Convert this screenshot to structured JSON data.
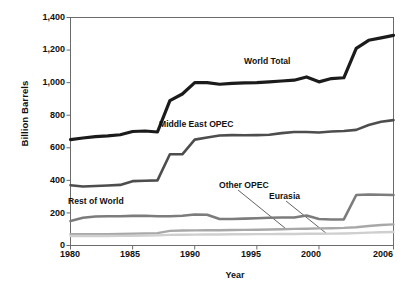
{
  "chart_data": {
    "type": "line",
    "title": "",
    "xlabel": "Year",
    "ylabel": "Billion Barrels",
    "xlim": [
      1980,
      2006
    ],
    "ylim": [
      0,
      1400
    ],
    "grid": false,
    "legend_position": "inline-labels",
    "xticks": [
      "1980",
      "1985",
      "1990",
      "1995",
      "2000",
      "2006"
    ],
    "xtick_values": [
      1980,
      1985,
      1990,
      1995,
      2000,
      2006
    ],
    "yticks": [
      "0",
      "200",
      "400",
      "600",
      "800",
      "1,000",
      "1,200",
      "1,400"
    ],
    "ytick_values": [
      0,
      200,
      400,
      600,
      800,
      1000,
      1200,
      1400
    ],
    "x": [
      1980,
      1981,
      1982,
      1983,
      1984,
      1985,
      1986,
      1987,
      1988,
      1989,
      1990,
      1991,
      1992,
      1993,
      1994,
      1995,
      1996,
      1997,
      1998,
      1999,
      2000,
      2001,
      2002,
      2003,
      2004,
      2005,
      2006
    ],
    "series": [
      {
        "name": "World Total",
        "color": "#1b1b1b",
        "width": 3.2,
        "values": [
          650,
          660,
          668,
          673,
          680,
          700,
          703,
          697,
          890,
          930,
          1000,
          1000,
          990,
          995,
          998,
          1000,
          1005,
          1010,
          1015,
          1035,
          1005,
          1025,
          1030,
          1210,
          1260,
          1275,
          1290
        ]
      },
      {
        "name": "Middle East OPEC",
        "color": "#4d4d4d",
        "width": 2.6,
        "values": [
          370,
          362,
          365,
          368,
          372,
          395,
          398,
          400,
          560,
          560,
          650,
          663,
          675,
          678,
          677,
          678,
          680,
          690,
          697,
          697,
          694,
          700,
          703,
          710,
          740,
          760,
          770
        ]
      },
      {
        "name": "Rest of World",
        "color": "#7c7c7c",
        "width": 2.6,
        "values": [
          150,
          170,
          178,
          180,
          180,
          182,
          183,
          180,
          180,
          183,
          190,
          189,
          163,
          163,
          165,
          167,
          170,
          172,
          172,
          184,
          163,
          160,
          160,
          310,
          313,
          312,
          310
        ]
      },
      {
        "name": "Other OPEC",
        "color": "#a8a8a8",
        "width": 2.4,
        "values": [
          70,
          70,
          70,
          70,
          71,
          72,
          74,
          76,
          90,
          92,
          93,
          94,
          94,
          95,
          96,
          97,
          98,
          100,
          102,
          103,
          105,
          106,
          108,
          112,
          120,
          126,
          130
        ]
      },
      {
        "name": "Eurasia",
        "color": "#cfcfcf",
        "width": 2.4,
        "values": [
          58,
          58,
          58,
          58,
          59,
          60,
          61,
          62,
          65,
          66,
          67,
          68,
          68,
          69,
          69,
          70,
          70,
          71,
          71,
          72,
          72,
          73,
          74,
          76,
          79,
          81,
          83
        ]
      }
    ],
    "annotations": [
      {
        "text": "World Total",
        "series": "World Total"
      },
      {
        "text": "Middle East OPEC",
        "series": "Middle East OPEC"
      },
      {
        "text": "Rest of World",
        "series": "Rest of World"
      },
      {
        "text": "Other OPEC",
        "series": "Other OPEC",
        "leader_line": true
      },
      {
        "text": "Eurasia",
        "series": "Eurasia",
        "leader_line": true
      }
    ]
  }
}
